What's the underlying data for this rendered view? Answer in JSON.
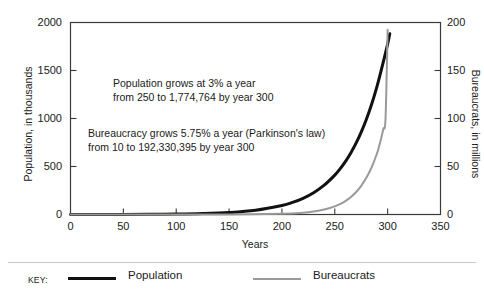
{
  "chart_data": {
    "type": "line",
    "title": "",
    "xlabel": "Years",
    "ylabel": "Population, in thousands",
    "y2label": "Bureaucrats, in millions",
    "xlim": [
      0,
      350
    ],
    "ylim": [
      0,
      2000
    ],
    "y2lim": [
      0,
      200
    ],
    "xticks": [
      0,
      50,
      100,
      150,
      200,
      250,
      300,
      350
    ],
    "xtick_labels": [
      "0",
      "50",
      "100",
      "150",
      "200",
      "250",
      "300",
      "350"
    ],
    "yticks": [
      0,
      500,
      1000,
      1500,
      2000
    ],
    "ytick_labels": [
      "0",
      "500",
      "1000",
      "1500",
      "2000"
    ],
    "y2ticks": [
      0,
      50,
      100,
      150,
      200
    ],
    "y2tick_labels": [
      "0",
      "50",
      "100",
      "150",
      "200"
    ],
    "grid": false,
    "legend_position": "below-axes",
    "series": [
      {
        "name": "Population",
        "axis": "left",
        "color": "#111111",
        "width": 3,
        "growth_rate_percent": 3,
        "start_value": 250,
        "end_value": 1774764,
        "x": [
          0,
          25,
          50,
          75,
          100,
          125,
          150,
          175,
          200,
          210,
          220,
          230,
          240,
          250,
          255,
          260,
          265,
          270,
          275,
          280,
          285,
          290,
          295,
          300,
          302
        ],
        "y": [
          0.25,
          0.52,
          1.1,
          2.3,
          4.8,
          10.2,
          21.3,
          44.7,
          93.6,
          125.8,
          169.1,
          227.1,
          305.2,
          410.1,
          475.4,
          551.1,
          638.8,
          740.5,
          858.4,
          995.1,
          1153.6,
          1337.3,
          1550.3,
          1774.8,
          1883.3
        ]
      },
      {
        "name": "Bureaucrats",
        "axis": "right",
        "color": "#9a9a9a",
        "width": 2,
        "growth_rate_percent": 5.75,
        "start_value": 10,
        "end_value": 192330395,
        "x": [
          0,
          50,
          100,
          150,
          200,
          220,
          230,
          240,
          250,
          255,
          260,
          265,
          270,
          275,
          280,
          285,
          290,
          292,
          294,
          296,
          298,
          300
        ],
        "y": [
          1e-05,
          0.00016,
          0.0026,
          0.042,
          0.68,
          1.87,
          3.09,
          5.12,
          8.47,
          10.9,
          14.0,
          18.0,
          23.2,
          29.9,
          38.5,
          49.5,
          63.8,
          71.4,
          79.9,
          89.4,
          100.1,
          192.33
        ]
      }
    ],
    "annotations": [
      {
        "name": "population-note",
        "line1": "Population grows at 3% a year",
        "line2": "from 250 to 1,774,764 by year 300"
      },
      {
        "name": "bureaucracy-note",
        "line1": "Bureaucracy grows 5.75% a year (Parkinson's law)",
        "line2": "from 10 to 192,330,395 by year 300"
      }
    ]
  },
  "legend": {
    "title": "KEY:",
    "entries": [
      {
        "label": "Population",
        "color": "#111111"
      },
      {
        "label": "Bureaucrats",
        "color": "#9a9a9a"
      }
    ]
  }
}
